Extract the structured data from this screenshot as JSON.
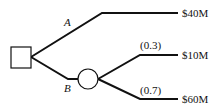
{
  "diagram": {
    "type": "decision-tree",
    "decision_node": {
      "shape": "square"
    },
    "branches": [
      {
        "label": "A",
        "outcome": "$40M"
      },
      {
        "label": "B",
        "chance_node": {
          "shape": "circle"
        },
        "outcomes": [
          {
            "probability": "(0.3)",
            "value": "$10M"
          },
          {
            "probability": "(0.7)",
            "value": "$60M"
          }
        ]
      }
    ]
  },
  "colors": {
    "line": "#111111",
    "background": "#ffffff"
  }
}
